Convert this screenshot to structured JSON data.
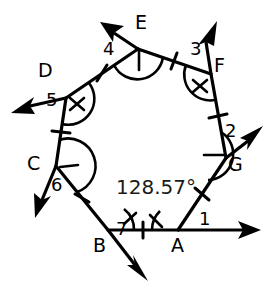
{
  "figure": {
    "shape": "heptagon",
    "background_color": "#ffffff",
    "stroke_color": "#000000",
    "interior_angle_measure": "128.57°"
  },
  "vertices": [
    {
      "label": "A",
      "x": 178,
      "y": 230,
      "label_x": 171,
      "label_y": 236
    },
    {
      "label": "B",
      "x": 108,
      "y": 230,
      "label_x": 96,
      "label_y": 236
    },
    {
      "label": "C",
      "x": 56,
      "y": 166,
      "label_x": 29,
      "label_y": 156
    },
    {
      "label": "D",
      "x": 66,
      "y": 98,
      "label_x": 38,
      "label_y": 64
    },
    {
      "label": "E",
      "x": 138,
      "y": 49,
      "label_x": 137,
      "label_y": 15
    },
    {
      "label": "F",
      "x": 211,
      "y": 74,
      "label_x": 212,
      "label_y": 58
    },
    {
      "label": "G",
      "x": 226,
      "y": 158,
      "label_x": 225,
      "label_y": 160
    }
  ],
  "exterior_angle_labels": [
    {
      "text": "1",
      "x": 199,
      "y": 212
    },
    {
      "text": "2",
      "x": 226,
      "y": 125
    },
    {
      "text": "3",
      "x": 190,
      "y": 42
    },
    {
      "text": "4",
      "x": 104,
      "y": 41
    },
    {
      "text": "5",
      "x": 47,
      "y": 92
    },
    {
      "text": "6",
      "x": 52,
      "y": 178
    },
    {
      "text": "7",
      "x": 116,
      "y": 222
    }
  ],
  "angle_measure_label": {
    "text": "128.57°",
    "x": 116,
    "y": 178
  },
  "sides": [
    {
      "from": "A",
      "to": "B"
    },
    {
      "from": "B",
      "to": "C"
    },
    {
      "from": "C",
      "to": "D"
    },
    {
      "from": "D",
      "to": "E"
    },
    {
      "from": "E",
      "to": "F"
    },
    {
      "from": "F",
      "to": "G"
    },
    {
      "from": "G",
      "to": "A"
    }
  ],
  "side_tick_marks": 1,
  "exterior_rays": [
    {
      "at": "A",
      "tip_x": 261,
      "tip_y": 230,
      "direction": "right"
    },
    {
      "at": "B",
      "tip_x": 146,
      "tip_y": 279,
      "direction": "down-right"
    },
    {
      "at": "C",
      "tip_x": 36,
      "tip_y": 215,
      "direction": "down-left"
    },
    {
      "at": "D",
      "tip_x": 12,
      "tip_y": 113,
      "direction": "left-down"
    },
    {
      "at": "E",
      "tip_x": 103,
      "tip_y": 23,
      "direction": "up-left"
    },
    {
      "at": "F",
      "tip_x": 216,
      "tip_y": 22,
      "direction": "up"
    },
    {
      "at": "G",
      "tip_x": 262,
      "tip_y": 127,
      "direction": "up-right"
    }
  ]
}
